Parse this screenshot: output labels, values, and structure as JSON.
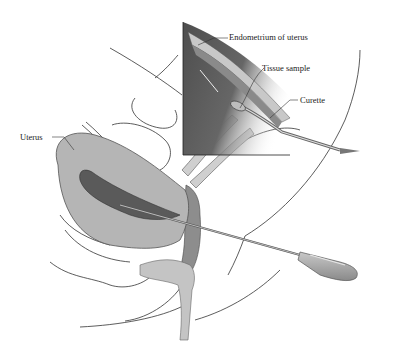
{
  "figure": {
    "labels": {
      "endometrium": "Endometrium of uterus",
      "tissue_sample": "Tissue sample",
      "curette": "Curette",
      "uterus": "Uterus"
    },
    "colors": {
      "uterus_fill": "#b5b5b5",
      "cavity_fill": "#5a5a5a",
      "inset_dark": "#555555",
      "inset_light": "#c8c8c8",
      "instrument": "#a8a8a8",
      "outline": "#333333"
    }
  }
}
